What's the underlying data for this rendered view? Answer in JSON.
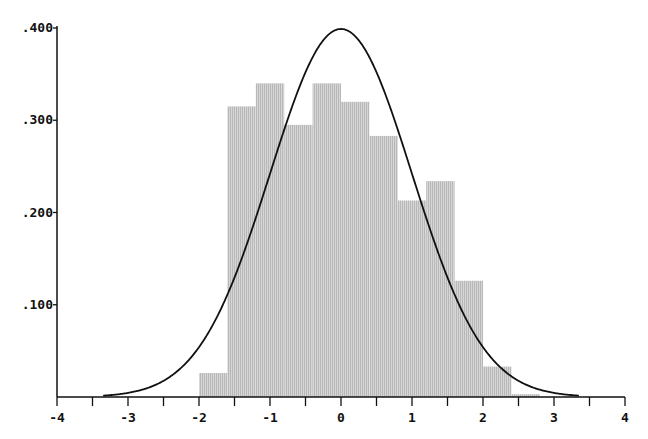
{
  "chart_data": {
    "type": "bar",
    "title": "",
    "xlabel": "",
    "ylabel": "",
    "xlim": [
      -4,
      4
    ],
    "ylim": [
      0,
      0.4
    ],
    "x_ticks": [
      -4,
      -3,
      -2,
      -1,
      0,
      1,
      2,
      3,
      4
    ],
    "x_tick_labels": [
      "-4",
      "-3",
      "-2",
      "-1",
      "0",
      "1",
      "2",
      "3",
      "4"
    ],
    "x_minor_ticks": [
      -3.5,
      -2.5,
      -1.5,
      -0.5,
      0.5,
      1.5,
      2.5,
      3.5
    ],
    "y_ticks": [
      0.1,
      0.2,
      0.3,
      0.4
    ],
    "y_tick_labels": [
      ".100",
      ".200",
      ".300",
      ".400"
    ],
    "grid": false,
    "legend": null,
    "series": [
      {
        "name": "histogram",
        "type": "bar",
        "color": "#c8c8c8",
        "bin_width": 0.4,
        "bins": [
          {
            "x0": -2.0,
            "x1": -1.6,
            "value": 0.026
          },
          {
            "x0": -1.6,
            "x1": -1.2,
            "value": 0.315
          },
          {
            "x0": -1.2,
            "x1": -0.8,
            "value": 0.34
          },
          {
            "x0": -0.8,
            "x1": -0.4,
            "value": 0.295
          },
          {
            "x0": -0.4,
            "x1": 0.0,
            "value": 0.34
          },
          {
            "x0": 0.0,
            "x1": 0.4,
            "value": 0.32
          },
          {
            "x0": 0.4,
            "x1": 0.8,
            "value": 0.283
          },
          {
            "x0": 0.8,
            "x1": 1.2,
            "value": 0.213
          },
          {
            "x0": 1.2,
            "x1": 1.6,
            "value": 0.234
          },
          {
            "x0": 1.6,
            "x1": 2.0,
            "value": 0.126
          },
          {
            "x0": 2.0,
            "x1": 2.4,
            "value": 0.033
          },
          {
            "x0": 2.4,
            "x1": 2.8,
            "value": 0.003
          }
        ]
      },
      {
        "name": "normal density curve",
        "type": "line",
        "color": "#111111",
        "function": "standard normal pdf (mean 0, sd 1)",
        "x_range": [
          -3.35,
          3.35
        ],
        "peak": {
          "x": 0,
          "y": 0.399
        }
      }
    ]
  }
}
